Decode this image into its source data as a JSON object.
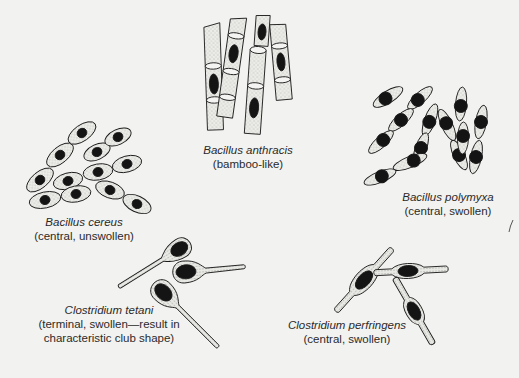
{
  "figure": {
    "background": "#f2f2f0",
    "ink_color": "#1a1a1a",
    "cell_fill": "#e6e6e2",
    "spore_fill": "#141414"
  },
  "organisms": [
    {
      "id": "bacillus-anthracis",
      "species": "Bacillus anthracis",
      "description": "(bamboo-like)",
      "spore_position": "central",
      "morphology": "bamboo-like chains of square-ended rods"
    },
    {
      "id": "bacillus-cereus",
      "species": "Bacillus cereus",
      "description": "(central, unswollen)",
      "spore_position": "central",
      "morphology": "oval rods in chains"
    },
    {
      "id": "bacillus-polymyxa",
      "species": "Bacillus polymyxa",
      "description": "(central, swollen)",
      "spore_position": "central",
      "morphology": "tapered rods with swollen center"
    },
    {
      "id": "clostridium-tetani",
      "species": "Clostridium tetani",
      "description": "(terminal, swollen—result in",
      "description_line2": "characteristic club shape)",
      "spore_position": "terminal",
      "morphology": "drumstick / club shape"
    },
    {
      "id": "clostridium-perfringens",
      "species": "Clostridium perfringens",
      "description": "(central, swollen)",
      "spore_position": "central",
      "morphology": "spindle-shaped swollen center"
    }
  ]
}
